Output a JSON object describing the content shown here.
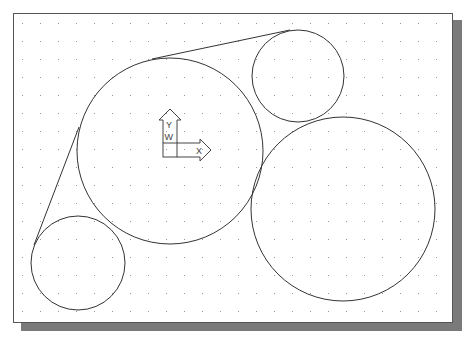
{
  "canvas": {
    "width": 471,
    "height": 339,
    "background": "#ffffff",
    "frame": {
      "x": 13,
      "y": 13,
      "w": 440,
      "h": 310,
      "border": "#555555"
    },
    "shadow": {
      "offset": 8,
      "color": "#7a7a7a"
    },
    "grid": {
      "spacing": 18,
      "origin_x": 22,
      "origin_y": 23,
      "dot_color": "#9a9a9a"
    }
  },
  "geometry": {
    "stroke": "#333333",
    "circles": [
      {
        "name": "large-center-circle",
        "cx": 170,
        "cy": 151,
        "r": 93
      },
      {
        "name": "large-right-circle",
        "cx": 343,
        "cy": 209,
        "r": 92
      },
      {
        "name": "small-top-circle",
        "cx": 298,
        "cy": 76,
        "r": 46
      },
      {
        "name": "small-bottom-left-circle",
        "cx": 78,
        "cy": 263,
        "r": 47
      }
    ],
    "lines": [
      {
        "name": "top-tangent-line",
        "x1": 152,
        "y1": 59,
        "x2": 290,
        "y2": 30
      },
      {
        "name": "left-tangent-line",
        "x1": 79,
        "y1": 127,
        "x2": 34,
        "y2": 245
      }
    ]
  },
  "ucs_icon": {
    "origin_x": 163,
    "origin_y": 157,
    "x_label": "X",
    "y_label": "Y",
    "w_label": "W"
  }
}
